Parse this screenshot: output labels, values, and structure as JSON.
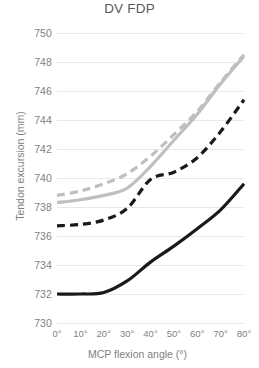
{
  "chart_data": {
    "type": "line",
    "title": "DV FDP",
    "xlabel": "MCP flexion angle (°)",
    "ylabel": "Tendon excursion (mm)",
    "x": [
      0,
      10,
      20,
      30,
      40,
      50,
      60,
      70,
      80
    ],
    "xtick_labels": [
      "0°",
      "10°",
      "20°",
      "30°",
      "40°",
      "50°",
      "60°",
      "70°",
      "80°"
    ],
    "ytick_labels": [
      "730",
      "732",
      "734",
      "736",
      "738",
      "740",
      "742",
      "744",
      "746",
      "748",
      "750"
    ],
    "yticks": [
      730,
      732,
      734,
      736,
      738,
      740,
      742,
      744,
      746,
      748,
      750
    ],
    "xlim": [
      0,
      80
    ],
    "ylim": [
      730,
      750
    ],
    "grid": true,
    "legend": "none",
    "series": [
      {
        "name": "gray-dashed",
        "style": "dashed",
        "color": "#bfbfbf",
        "values": [
          738.8,
          739.1,
          739.6,
          740.3,
          741.5,
          743.0,
          744.6,
          746.6,
          748.5
        ]
      },
      {
        "name": "gray-solid",
        "style": "solid",
        "color": "#bfbfbf",
        "values": [
          738.3,
          738.5,
          738.8,
          739.3,
          740.8,
          742.6,
          744.4,
          746.5,
          748.4
        ]
      },
      {
        "name": "black-dashed",
        "style": "dashed",
        "color": "#1a1a1a",
        "values": [
          736.7,
          736.8,
          737.1,
          737.9,
          739.9,
          740.4,
          741.4,
          743.2,
          745.4
        ]
      },
      {
        "name": "black-solid",
        "style": "solid",
        "color": "#1a1a1a",
        "values": [
          732.0,
          732.0,
          732.1,
          732.9,
          734.2,
          735.3,
          736.5,
          737.8,
          739.6
        ]
      }
    ]
  }
}
